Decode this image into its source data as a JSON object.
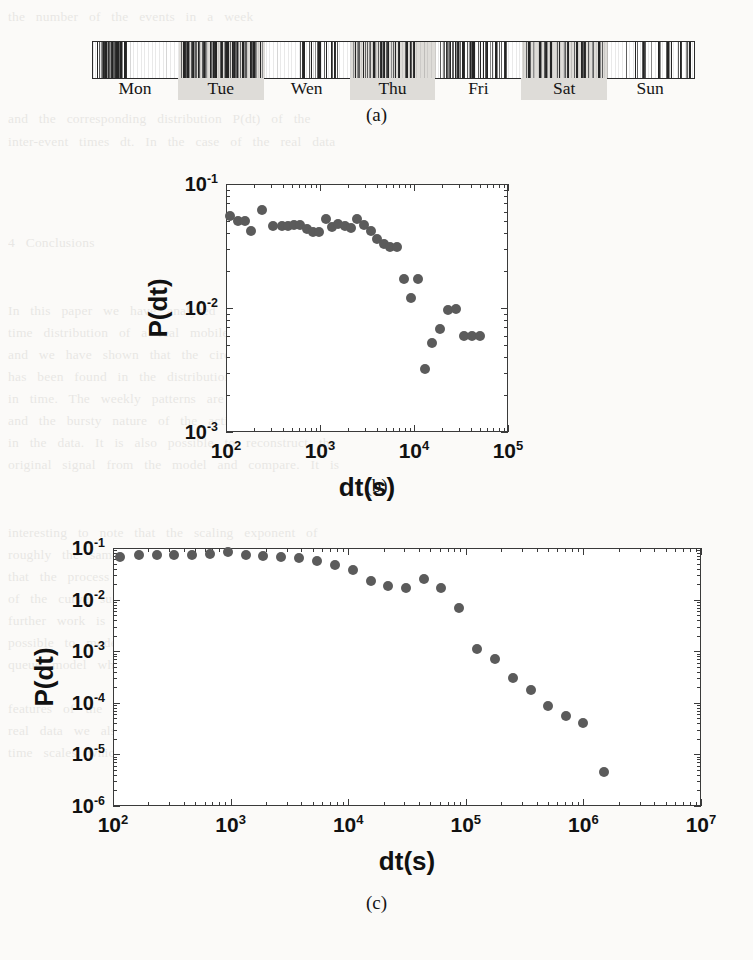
{
  "figure": {
    "panels": [
      {
        "id": "a",
        "caption": "(a)"
      },
      {
        "id": "b",
        "caption": "(b)"
      },
      {
        "id": "c",
        "caption": "(c)"
      }
    ]
  },
  "panel_a": {
    "caption": "(a)",
    "day_labels": [
      "Mon",
      "Tue",
      "Wen",
      "Thu",
      "Fri",
      "Sat",
      "Sun"
    ],
    "shaded_days": [
      "Tue",
      "Thu",
      "Sat"
    ],
    "description": "event raster over one week"
  },
  "panel_b": {
    "caption": "(b)",
    "xlabel": "dt(s)",
    "ylabel": "P(dt)"
  },
  "panel_c": {
    "caption": "(c)",
    "xlabel": "dt(s)",
    "ylabel": "P(dt)"
  },
  "colors": {
    "marker": "#5b5b5b",
    "axis": "#3a3a3a",
    "band": "#dedcd8",
    "page": "#fbfaf8"
  },
  "chart_data": [
    {
      "type": "raster",
      "panel": "a",
      "title": "",
      "xlabel": "",
      "ylabel": "",
      "categories": [
        "Mon",
        "Tue",
        "Wen",
        "Thu",
        "Fri",
        "Sat",
        "Sun"
      ],
      "shaded": [
        false,
        true,
        false,
        true,
        false,
        true,
        false
      ],
      "xlim": [
        0,
        7
      ],
      "note": "vertical tick marks mark individual communication events across one week",
      "events": [
        0.055,
        0.072,
        0.091,
        0.108,
        0.118,
        0.131,
        0.142,
        0.15,
        0.156,
        0.161,
        0.166,
        0.171,
        0.176,
        0.18,
        0.185,
        0.19,
        0.196,
        0.203,
        0.21,
        0.216,
        0.223,
        0.231,
        0.24,
        0.249,
        0.258,
        0.266,
        0.274,
        0.281,
        0.289,
        0.301,
        0.318,
        0.333,
        0.348,
        0.362,
        1.02,
        1.05,
        1.09,
        1.12,
        1.15,
        1.19,
        1.23,
        1.27,
        1.31,
        1.35,
        1.39,
        1.43,
        1.47,
        1.51,
        1.55,
        1.6,
        1.63,
        1.66,
        1.7,
        1.74,
        1.78,
        1.82,
        1.86,
        1.9,
        1.94,
        2.4,
        2.46,
        2.52,
        2.58,
        2.63,
        2.7,
        2.77,
        2.84,
        3.02,
        3.06,
        3.1,
        3.14,
        3.18,
        3.22,
        3.27,
        3.32,
        3.37,
        3.42,
        3.48,
        3.55,
        3.62,
        3.7,
        4.04,
        4.07,
        4.1,
        4.13,
        4.16,
        4.19,
        4.22,
        4.25,
        4.28,
        4.31,
        4.35,
        4.39,
        4.43,
        4.48,
        4.53,
        4.58,
        4.63,
        4.68,
        4.74,
        4.8,
        5.05,
        5.12,
        5.19,
        5.26,
        5.33,
        5.4,
        5.47,
        5.54,
        5.61,
        5.68,
        5.75,
        5.82,
        5.89,
        6.2,
        6.3,
        6.4,
        6.5,
        6.58,
        6.66,
        6.74,
        6.82,
        6.9
      ]
    },
    {
      "type": "scatter",
      "panel": "b",
      "title": "",
      "xlabel": "dt(s)",
      "ylabel": "P(dt)",
      "xscale": "log",
      "yscale": "log",
      "xlim": [
        100,
        100000
      ],
      "ylim": [
        0.001,
        0.1
      ],
      "xticks": [
        100,
        1000,
        10000,
        100000
      ],
      "xticklabels": [
        "10²",
        "10³",
        "10⁴",
        "10⁵"
      ],
      "yticks": [
        0.001,
        0.01,
        0.1
      ],
      "yticklabels": [
        "10⁻³",
        "10⁻²",
        "10⁻¹"
      ],
      "grid": false,
      "legend": null,
      "x": [
        110,
        135,
        158,
        185,
        240,
        320,
        390,
        455,
        530,
        620,
        720,
        840,
        980,
        1150,
        1350,
        1560,
        1830,
        2150,
        2500,
        2950,
        3450,
        4050,
        4750,
        5600,
        6600,
        7800,
        9300,
        11000,
        13000,
        15500,
        19000,
        23000,
        28000,
        34000,
        41000,
        50000
      ],
      "y": [
        0.055,
        0.05,
        0.05,
        0.042,
        0.062,
        0.046,
        0.046,
        0.046,
        0.047,
        0.047,
        0.043,
        0.041,
        0.041,
        0.052,
        0.045,
        0.048,
        0.046,
        0.044,
        0.052,
        0.047,
        0.042,
        0.036,
        0.033,
        0.031,
        0.031,
        0.017,
        0.012,
        0.017,
        0.0032,
        0.0052,
        0.0068,
        0.0097,
        0.0099,
        0.006,
        0.006,
        0.006
      ]
    },
    {
      "type": "scatter",
      "panel": "c",
      "title": "",
      "xlabel": "dt(s)",
      "ylabel": "P(dt)",
      "xscale": "log",
      "yscale": "log",
      "xlim": [
        100,
        10000000
      ],
      "ylim": [
        1e-06,
        0.1
      ],
      "xticks": [
        100,
        1000,
        10000,
        100000,
        1000000,
        10000000
      ],
      "xticklabels": [
        "10²",
        "10³",
        "10⁴",
        "10⁵",
        "10⁶",
        "10⁷"
      ],
      "yticks": [
        1e-06,
        1e-05,
        0.0001,
        0.001,
        0.01,
        0.1
      ],
      "yticklabels": [
        "10⁻⁶",
        "10⁻⁵",
        "10⁻⁴",
        "10⁻³",
        "10⁻²",
        "10⁻¹"
      ],
      "grid": false,
      "legend": null,
      "x": [
        115,
        165,
        235,
        330,
        470,
        670,
        950,
        1350,
        1900,
        2700,
        3800,
        5400,
        7700,
        11000,
        15500,
        22000,
        31000,
        44000,
        62000,
        88000,
        125000,
        178000,
        250000,
        355000,
        500000,
        710000,
        1000000,
        1500000
      ],
      "y": [
        0.068,
        0.072,
        0.072,
        0.073,
        0.074,
        0.076,
        0.082,
        0.072,
        0.071,
        0.068,
        0.064,
        0.056,
        0.046,
        0.037,
        0.023,
        0.018,
        0.017,
        0.025,
        0.017,
        0.0068,
        0.0011,
        0.00072,
        0.0003,
        0.00018,
        8.5e-05,
        5.5e-05,
        4e-05,
        4.6e-06
      ]
    }
  ]
}
